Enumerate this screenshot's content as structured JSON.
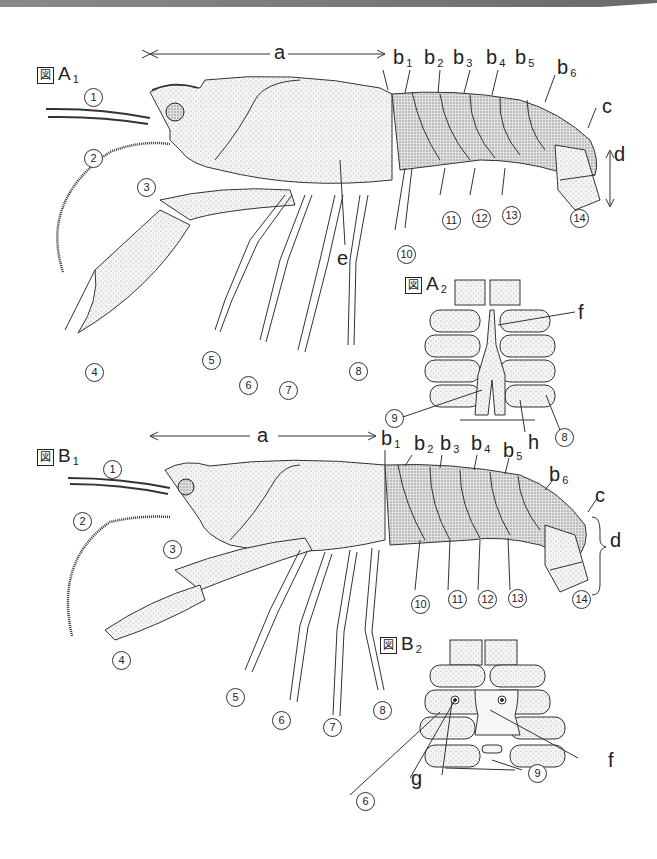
{
  "figures": {
    "A1": {
      "prefix": "図",
      "letter": "A",
      "sub": "1"
    },
    "A2": {
      "prefix": "図",
      "letter": "A",
      "sub": "2"
    },
    "B1": {
      "prefix": "図",
      "letter": "B",
      "sub": "1"
    },
    "B2": {
      "prefix": "図",
      "letter": "B",
      "sub": "2"
    }
  },
  "letters": {
    "a": "a",
    "c": "c",
    "d": "d",
    "e": "e",
    "f": "f",
    "g": "g",
    "h": "h",
    "b": "b",
    "b_subs": [
      "1",
      "2",
      "3",
      "4",
      "5",
      "6"
    ]
  },
  "numbers": {
    "n1": "1",
    "n2": "2",
    "n3": "3",
    "n4": "4",
    "n5": "5",
    "n6": "6",
    "n7": "7",
    "n8": "8",
    "n9": "9",
    "n10": "10",
    "n11": "11",
    "n12": "12",
    "n13": "13",
    "n14": "14"
  },
  "colors": {
    "ink": "#222222",
    "topbar": "#7a7a7a",
    "shell": "#f3f3f3",
    "shade": "#cfcfcf"
  }
}
